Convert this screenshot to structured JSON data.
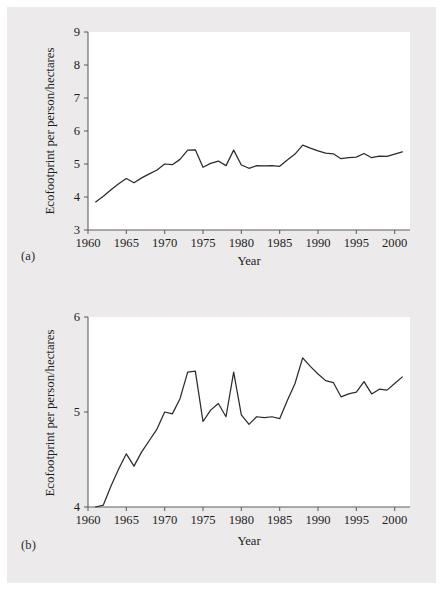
{
  "figure": {
    "panels": [
      {
        "tag": "(a)",
        "xlabel": "Year",
        "ylabel": "Ecofootprint per person/hectares",
        "ylim": [
          3,
          9
        ],
        "yticks": [
          3,
          4,
          5,
          6,
          7,
          8,
          9
        ],
        "yticklabels": [
          "3",
          "4",
          "5",
          "6",
          "7",
          "8",
          "9"
        ],
        "xlim": [
          1960,
          2002
        ],
        "xticks": [
          1960,
          1965,
          1970,
          1975,
          1980,
          1985,
          1990,
          1995,
          2000
        ],
        "xticklabels": [
          "1960",
          "1965",
          "1970",
          "1975",
          "1980",
          "1985",
          "1990",
          "1995",
          "2000"
        ]
      },
      {
        "tag": "(b)",
        "xlabel": "Year",
        "ylabel": "Ecofootprint per person/hectares",
        "ylim": [
          4,
          6
        ],
        "yticks": [
          4,
          5,
          6
        ],
        "yticklabels": [
          "4",
          "5",
          "6"
        ],
        "xlim": [
          1960,
          2002
        ],
        "xticks": [
          1960,
          1965,
          1970,
          1975,
          1980,
          1985,
          1990,
          1995,
          2000
        ],
        "xticklabels": [
          "1960",
          "1965",
          "1970",
          "1975",
          "1980",
          "1985",
          "1990",
          "1995",
          "2000"
        ]
      }
    ]
  },
  "chart_data": [
    {
      "type": "line",
      "title": "",
      "panel": "(a)",
      "xlabel": "Year",
      "ylabel": "Ecofootprint per person/hectares",
      "xlim": [
        1960,
        2002
      ],
      "ylim": [
        3,
        9
      ],
      "grid": false,
      "legend": null,
      "x": [
        1961,
        1962,
        1963,
        1964,
        1965,
        1966,
        1967,
        1968,
        1969,
        1970,
        1971,
        1972,
        1973,
        1974,
        1975,
        1976,
        1977,
        1978,
        1979,
        1980,
        1981,
        1982,
        1983,
        1984,
        1985,
        1986,
        1987,
        1988,
        1989,
        1990,
        1991,
        1992,
        1993,
        1994,
        1995,
        1996,
        1997,
        1998,
        1999,
        2000,
        2001
      ],
      "y": [
        3.85,
        4.02,
        4.22,
        4.4,
        4.56,
        4.43,
        4.58,
        4.7,
        4.82,
        5.0,
        4.98,
        5.14,
        5.42,
        5.43,
        4.9,
        5.02,
        5.09,
        4.95,
        5.42,
        4.97,
        4.87,
        4.95,
        4.94,
        4.95,
        4.93,
        5.12,
        5.3,
        5.57,
        5.48,
        5.4,
        5.33,
        5.31,
        5.16,
        5.19,
        5.21,
        5.32,
        5.19,
        5.24,
        5.23,
        5.3,
        5.37
      ]
    },
    {
      "type": "line",
      "title": "",
      "panel": "(b)",
      "xlabel": "Year",
      "ylabel": "Ecofootprint per person/hectares",
      "xlim": [
        1960,
        2002
      ],
      "ylim": [
        4,
        6
      ],
      "grid": false,
      "legend": null,
      "x": [
        1961,
        1962,
        1963,
        1964,
        1965,
        1966,
        1967,
        1968,
        1969,
        1970,
        1971,
        1972,
        1973,
        1974,
        1975,
        1976,
        1977,
        1978,
        1979,
        1980,
        1981,
        1982,
        1983,
        1984,
        1985,
        1986,
        1987,
        1988,
        1989,
        1990,
        1991,
        1992,
        1993,
        1994,
        1995,
        1996,
        1997,
        1998,
        1999,
        2000,
        2001
      ],
      "y": [
        3.85,
        4.02,
        4.22,
        4.4,
        4.56,
        4.43,
        4.58,
        4.7,
        4.82,
        5.0,
        4.98,
        5.14,
        5.42,
        5.43,
        4.9,
        5.02,
        5.09,
        4.95,
        5.42,
        4.97,
        4.87,
        4.95,
        4.94,
        4.95,
        4.93,
        5.12,
        5.3,
        5.57,
        5.48,
        5.4,
        5.33,
        5.31,
        5.16,
        5.19,
        5.21,
        5.32,
        5.19,
        5.24,
        5.23,
        5.3,
        5.37
      ]
    }
  ]
}
